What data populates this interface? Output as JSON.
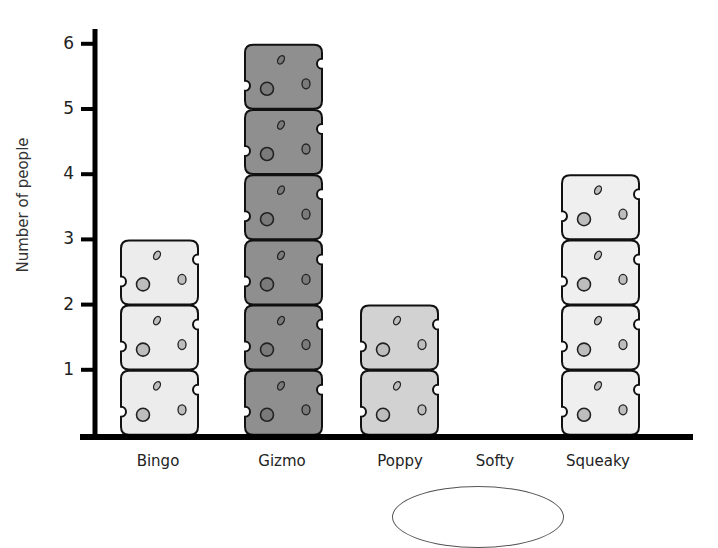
{
  "chart_data": {
    "type": "bar",
    "style": "pictogram",
    "title": "",
    "xlabel": "",
    "ylabel": "Number of people",
    "categories": [
      "Bingo",
      "Gizmo",
      "Poppy",
      "Softy",
      "Squeaky"
    ],
    "values": [
      3,
      6,
      2,
      0,
      4
    ],
    "yticks": [
      "1",
      "2",
      "3",
      "4",
      "5",
      "6"
    ],
    "ylim": [
      0,
      6
    ],
    "grid": false,
    "legend": "none",
    "unit_symbol": "cheese-block",
    "colors": {
      "Bingo": "#ececec",
      "Gizmo": "#8f8f8f",
      "Poppy": "#d2d2d2",
      "Softy": "#ececec",
      "Squeaky": "#efefef"
    },
    "axis_color": "#000000",
    "outline_color": "#111111",
    "hole_color": "#bdbdbd"
  }
}
